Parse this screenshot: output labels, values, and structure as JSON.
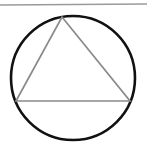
{
  "canvas": {
    "width": 147,
    "height": 146,
    "background_color": "#ffffff",
    "title": "Circle with inscribed triangle"
  },
  "top_rule": {
    "name": "horizontal-rule",
    "color": "#9a9a9a",
    "x1": 0,
    "y1": 5,
    "x2": 147,
    "y2": 4,
    "stroke_width": 1.6
  },
  "circle": {
    "name": "circle",
    "center_x": 73,
    "center_y": 78,
    "radius": 62,
    "stroke_color": "#111111",
    "stroke_width": 2.6,
    "fill": "none"
  },
  "triangle": {
    "name": "inscribed-triangle",
    "stroke_color": "#8a8a8a",
    "stroke_width": 1.7,
    "fill": "none",
    "vertices": [
      {
        "label": "apex",
        "x": 62,
        "y": 17
      },
      {
        "label": "right-base",
        "x": 130,
        "y": 101
      },
      {
        "label": "left-base",
        "x": 16,
        "y": 101
      }
    ],
    "base_line": {
      "name": "triangle-base",
      "x1": 16,
      "y1": 101,
      "x2": 130,
      "y2": 101
    }
  }
}
